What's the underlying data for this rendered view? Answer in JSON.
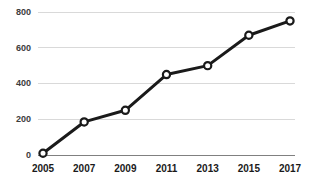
{
  "chart_data": {
    "type": "line",
    "title": "",
    "subtitle": "",
    "xlabel": "",
    "ylabel": "",
    "categories": [
      "2005",
      "2007",
      "2009",
      "2011",
      "2013",
      "2015",
      "2017"
    ],
    "x": [
      2005,
      2007,
      2009,
      2011,
      2013,
      2015,
      2017
    ],
    "values": [
      10,
      185,
      250,
      450,
      500,
      670,
      750
    ],
    "series": [
      {
        "name": "",
        "values": [
          10,
          185,
          250,
          450,
          500,
          670,
          750
        ]
      }
    ],
    "xlim": [
      2005,
      2017
    ],
    "ylim": [
      0,
      800
    ],
    "ytick_labels": [
      "0",
      "200",
      "400",
      "600",
      "800"
    ],
    "ytick_values": [
      0,
      200,
      400,
      600,
      800
    ],
    "xtick_labels": [
      "2005",
      "2007",
      "2009",
      "2011",
      "2013",
      "2015",
      "2017"
    ],
    "grid": true,
    "grid_axis": "y",
    "legend": false,
    "legend_position": "none",
    "annotations": [],
    "colors": {
      "line": "#1a1a1a",
      "marker_fill": "#ffffff",
      "marker_edge": "#1a1a1a",
      "gridline": "#d9d9d9",
      "axis": "#808080",
      "ytick_text": "#3c3c3c",
      "xtick_text": "#1a1a1a",
      "background": "#ffffff"
    }
  }
}
